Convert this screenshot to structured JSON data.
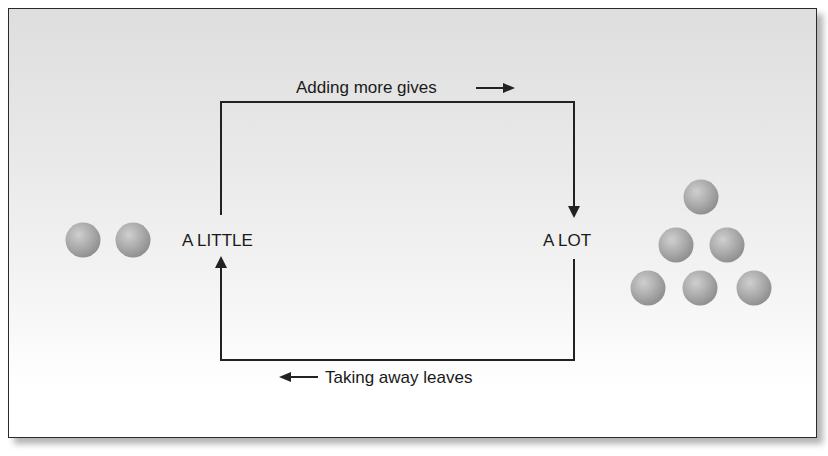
{
  "diagram": {
    "top_label": "Adding more gives",
    "bottom_label": "Taking away leaves",
    "left_node": "A LITTLE",
    "right_node": "A LOT",
    "colors": {
      "line": "#222222",
      "ball_light": "#c8c8c8",
      "ball_mid": "#a8a8a8",
      "ball_dark": "#8a8a8a",
      "background_top": "#dedede",
      "background_bottom": "#ffffff"
    },
    "left_group": {
      "ball_count": 2
    },
    "right_group": {
      "ball_count": 6,
      "arrangement": "pyramid"
    }
  }
}
